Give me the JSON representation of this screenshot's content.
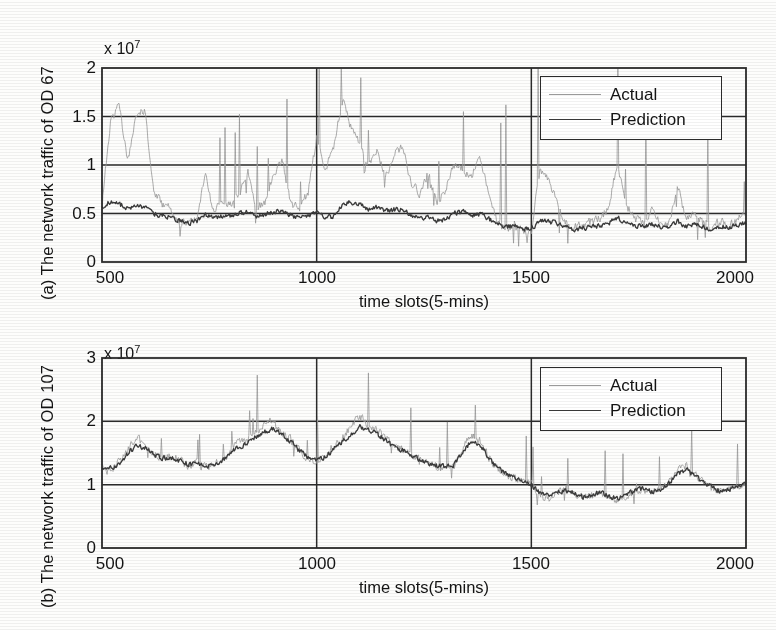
{
  "figure": {
    "background_color": "#fdfdfc",
    "axis_color": "#2b2b2b",
    "actual_color": "#9a9a9a",
    "prediction_color": "#3b3b3b"
  },
  "panels": [
    {
      "id": "a",
      "ylabel": "(a) The network traffic of OD 67",
      "xlabel": "time slots(5-mins)",
      "exponent_label": "x 10",
      "exponent_power": "7",
      "yticks": [
        "0",
        "0.5",
        "1",
        "1.5",
        "2"
      ],
      "xticks": [
        "500",
        "1000",
        "1500",
        "2000"
      ],
      "legend": {
        "actual": "Actual",
        "prediction": "Prediction"
      }
    },
    {
      "id": "b",
      "ylabel": "(b) The network traffic of OD 107",
      "xlabel": "time slots(5-mins)",
      "exponent_label": "x 10",
      "exponent_power": "7",
      "yticks": [
        "0",
        "1",
        "2",
        "3"
      ],
      "xticks": [
        "500",
        "1000",
        "1500",
        "2000"
      ],
      "legend": {
        "actual": "Actual",
        "prediction": "Prediction"
      }
    }
  ],
  "chart_data": [
    {
      "type": "line",
      "title": "",
      "xlabel": "time slots(5-mins)",
      "ylabel": "(a) The network traffic of OD 67",
      "y_exponent": 7,
      "y_tick_values": [
        0,
        0.5,
        1,
        1.5,
        2
      ],
      "x_tick_values": [
        500,
        1000,
        1500,
        2000
      ],
      "xlim": [
        500,
        2000
      ],
      "ylim": [
        0,
        2
      ],
      "grid": true,
      "legend": [
        "Actual",
        "Prediction"
      ],
      "legend_position": "top-right",
      "series": [
        {
          "name": "Actual",
          "color": "#9a9a9a",
          "description": "Noisy measured traffic with frequent tall spikes reaching 1.0-1.7e7 in the 500-1400 range, falling to a lower quieter band 0.15-1.0e7 after slot 1500",
          "x": [
            500,
            520,
            540,
            560,
            580,
            600,
            620,
            640,
            660,
            680,
            700,
            720,
            740,
            760,
            780,
            800,
            820,
            840,
            860,
            880,
            900,
            920,
            940,
            960,
            980,
            1000,
            1020,
            1040,
            1060,
            1080,
            1100,
            1120,
            1140,
            1160,
            1180,
            1200,
            1220,
            1240,
            1260,
            1280,
            1300,
            1320,
            1340,
            1360,
            1380,
            1400,
            1420,
            1440,
            1460,
            1480,
            1500,
            1520,
            1540,
            1560,
            1580,
            1600,
            1620,
            1640,
            1660,
            1680,
            1700,
            1720,
            1740,
            1760,
            1780,
            1800,
            1820,
            1840,
            1860,
            1880,
            1900,
            1920,
            1940,
            1960,
            1980,
            2000
          ],
          "values": [
            0.58,
            1.45,
            1.62,
            1.05,
            1.52,
            1.58,
            0.72,
            0.6,
            0.55,
            0.42,
            0.38,
            0.45,
            0.9,
            0.52,
            0.62,
            0.58,
            0.7,
            0.95,
            0.55,
            0.62,
            0.92,
            1.05,
            0.6,
            0.55,
            0.72,
            1.28,
            0.95,
            1.18,
            1.68,
            1.38,
            1.25,
            0.98,
            1.15,
            0.88,
            1.1,
            1.2,
            0.82,
            0.7,
            0.92,
            0.62,
            0.75,
            1.0,
            0.95,
            0.88,
            1.05,
            0.72,
            0.42,
            0.35,
            0.38,
            0.3,
            0.32,
            0.95,
            0.85,
            0.6,
            0.4,
            0.35,
            0.38,
            0.42,
            0.45,
            0.55,
            1.02,
            0.6,
            0.45,
            0.4,
            0.52,
            0.42,
            0.38,
            0.8,
            0.45,
            0.5,
            0.4,
            0.35,
            0.42,
            0.38,
            0.45,
            0.5
          ]
        },
        {
          "name": "Prediction",
          "color": "#3b3b3b",
          "description": "Smoothed tracking curve following the trend of Actual without capturing the tall spikes; baseline near 0.5e7 falling to ~0.38e7 after slot 1500",
          "x": [
            500,
            520,
            540,
            560,
            580,
            600,
            620,
            640,
            660,
            680,
            700,
            720,
            740,
            760,
            780,
            800,
            820,
            840,
            860,
            880,
            900,
            920,
            940,
            960,
            980,
            1000,
            1020,
            1040,
            1060,
            1080,
            1100,
            1120,
            1140,
            1160,
            1180,
            1200,
            1220,
            1240,
            1260,
            1280,
            1300,
            1320,
            1340,
            1360,
            1380,
            1400,
            1420,
            1440,
            1460,
            1480,
            1500,
            1520,
            1540,
            1560,
            1580,
            1600,
            1620,
            1640,
            1660,
            1680,
            1700,
            1720,
            1740,
            1760,
            1780,
            1800,
            1820,
            1840,
            1860,
            1880,
            1900,
            1920,
            1940,
            1960,
            1980,
            2000
          ],
          "values": [
            0.57,
            0.62,
            0.6,
            0.55,
            0.58,
            0.56,
            0.5,
            0.48,
            0.46,
            0.42,
            0.4,
            0.42,
            0.48,
            0.45,
            0.48,
            0.47,
            0.5,
            0.52,
            0.48,
            0.49,
            0.52,
            0.53,
            0.48,
            0.46,
            0.48,
            0.52,
            0.45,
            0.48,
            0.58,
            0.62,
            0.6,
            0.55,
            0.57,
            0.52,
            0.54,
            0.55,
            0.48,
            0.44,
            0.47,
            0.42,
            0.44,
            0.5,
            0.52,
            0.48,
            0.5,
            0.45,
            0.4,
            0.36,
            0.37,
            0.34,
            0.35,
            0.42,
            0.42,
            0.4,
            0.36,
            0.34,
            0.35,
            0.36,
            0.37,
            0.4,
            0.46,
            0.4,
            0.37,
            0.36,
            0.39,
            0.37,
            0.35,
            0.42,
            0.37,
            0.38,
            0.36,
            0.34,
            0.37,
            0.35,
            0.38,
            0.4
          ]
        }
      ]
    },
    {
      "type": "line",
      "title": "",
      "xlabel": "time slots(5-mins)",
      "ylabel": "(b) The network traffic of OD 107",
      "y_exponent": 7,
      "y_tick_values": [
        0,
        1,
        2,
        3
      ],
      "x_tick_values": [
        500,
        1000,
        1500,
        2000
      ],
      "xlim": [
        500,
        2000
      ],
      "ylim": [
        0,
        3
      ],
      "grid": true,
      "legend": [
        "Actual",
        "Prediction"
      ],
      "legend_position": "top-right",
      "series": [
        {
          "name": "Actual",
          "color": "#9a9a9a",
          "description": "Traffic oscillating between 1.0e7 and 2.1e7 from slot 500 to 1500 with peaks near slot 900 and 1150, then a level shift down to roughly 0.6-1.1e7 after slot 1500",
          "x": [
            500,
            520,
            540,
            560,
            580,
            600,
            620,
            640,
            660,
            680,
            700,
            720,
            740,
            760,
            780,
            800,
            820,
            840,
            860,
            880,
            900,
            920,
            940,
            960,
            980,
            1000,
            1020,
            1040,
            1060,
            1080,
            1100,
            1120,
            1140,
            1160,
            1180,
            1200,
            1220,
            1240,
            1260,
            1280,
            1300,
            1320,
            1340,
            1360,
            1380,
            1400,
            1420,
            1440,
            1460,
            1480,
            1500,
            1520,
            1540,
            1560,
            1580,
            1600,
            1620,
            1640,
            1660,
            1680,
            1700,
            1720,
            1740,
            1760,
            1780,
            1800,
            1820,
            1840,
            1860,
            1880,
            1900,
            1920,
            1940,
            1960,
            1980,
            2000
          ],
          "values": [
            1.3,
            1.25,
            1.35,
            1.55,
            1.75,
            1.62,
            1.5,
            1.42,
            1.45,
            1.38,
            1.3,
            1.35,
            1.28,
            1.32,
            1.4,
            1.55,
            1.68,
            1.72,
            1.85,
            1.95,
            2.05,
            1.8,
            1.72,
            1.55,
            1.42,
            1.38,
            1.45,
            1.62,
            1.75,
            1.9,
            2.1,
            1.95,
            1.88,
            1.75,
            1.62,
            1.55,
            1.48,
            1.4,
            1.32,
            1.28,
            1.25,
            1.3,
            1.55,
            1.8,
            1.7,
            1.45,
            1.25,
            1.15,
            1.1,
            1.05,
            1.02,
            0.82,
            0.78,
            0.88,
            0.92,
            0.85,
            0.78,
            0.82,
            0.88,
            0.8,
            0.75,
            0.82,
            0.9,
            0.95,
            0.88,
            0.92,
            1.05,
            1.22,
            1.3,
            1.18,
            1.05,
            0.95,
            0.88,
            0.92,
            0.98,
            1.05
          ]
        },
        {
          "name": "Prediction",
          "color": "#3b3b3b",
          "description": "Smoothed prediction closely tracking the Actual series including the post-1500 level shift",
          "x": [
            500,
            520,
            540,
            560,
            580,
            600,
            620,
            640,
            660,
            680,
            700,
            720,
            740,
            760,
            780,
            800,
            820,
            840,
            860,
            880,
            900,
            920,
            940,
            960,
            980,
            1000,
            1020,
            1040,
            1060,
            1080,
            1100,
            1120,
            1140,
            1160,
            1180,
            1200,
            1220,
            1240,
            1260,
            1280,
            1300,
            1320,
            1340,
            1360,
            1380,
            1400,
            1420,
            1440,
            1460,
            1480,
            1500,
            1520,
            1540,
            1560,
            1580,
            1600,
            1620,
            1640,
            1660,
            1680,
            1700,
            1720,
            1740,
            1760,
            1780,
            1800,
            1820,
            1840,
            1860,
            1880,
            1900,
            1920,
            1940,
            1960,
            1980,
            2000
          ],
          "values": [
            1.28,
            1.26,
            1.32,
            1.48,
            1.62,
            1.58,
            1.48,
            1.42,
            1.43,
            1.38,
            1.32,
            1.34,
            1.3,
            1.32,
            1.38,
            1.5,
            1.6,
            1.66,
            1.76,
            1.84,
            1.9,
            1.78,
            1.68,
            1.54,
            1.44,
            1.4,
            1.44,
            1.56,
            1.68,
            1.8,
            1.92,
            1.86,
            1.8,
            1.7,
            1.6,
            1.54,
            1.46,
            1.4,
            1.34,
            1.3,
            1.28,
            1.32,
            1.5,
            1.7,
            1.64,
            1.44,
            1.26,
            1.18,
            1.12,
            1.06,
            1.0,
            0.86,
            0.82,
            0.88,
            0.9,
            0.86,
            0.8,
            0.84,
            0.88,
            0.82,
            0.78,
            0.84,
            0.9,
            0.94,
            0.88,
            0.92,
            1.02,
            1.16,
            1.24,
            1.14,
            1.04,
            0.96,
            0.9,
            0.92,
            0.98,
            1.02
          ]
        }
      ]
    }
  ]
}
